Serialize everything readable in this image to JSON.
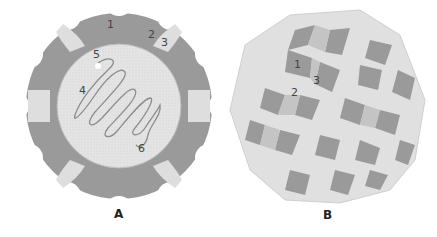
{
  "panels": [
    {
      "id": "A",
      "caption": "A",
      "labels": [
        "1",
        "2",
        "3",
        "4",
        "5",
        "6"
      ]
    },
    {
      "id": "B",
      "caption": "B",
      "labels": [
        "1",
        "2",
        "3"
      ]
    }
  ],
  "colors": {
    "dark": "#8a8a8a",
    "mid": "#b3b3b3",
    "light": "#dcdcdc",
    "very_light": "#efefef",
    "line": "#888888"
  }
}
